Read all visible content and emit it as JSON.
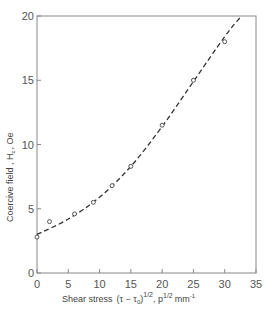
{
  "chart_data": {
    "type": "scatter",
    "title": "",
    "xlabel": "Shear stress (τ−τ₀)^1/2 , p^1/2 mm⁻¹",
    "ylabel": "Coercive field , Hc , Oe",
    "xlim": [
      0,
      35
    ],
    "ylim": [
      0,
      20
    ],
    "x_ticks": [
      0,
      5,
      10,
      15,
      20,
      25,
      30,
      35
    ],
    "y_ticks": [
      0,
      5,
      10,
      15,
      20
    ],
    "grid": false,
    "legend": null,
    "series": [
      {
        "name": "measured",
        "style": "open-circle",
        "x": [
          0,
          2,
          6,
          9,
          12,
          15,
          20,
          25,
          30
        ],
        "y": [
          2.8,
          4.0,
          4.6,
          5.5,
          6.8,
          8.3,
          11.5,
          15.0,
          18.0
        ]
      },
      {
        "name": "fit",
        "style": "dashed-line",
        "x": [
          0,
          5,
          10,
          15,
          20,
          25,
          30,
          32.5
        ],
        "y": [
          3.0,
          4.2,
          5.9,
          8.3,
          11.4,
          14.9,
          18.4,
          19.9
        ]
      }
    ]
  },
  "labels": {
    "x_axis": "Shear stress",
    "x_axis_formula": "(τ − τ",
    "x_axis_sub": "0",
    "x_axis_exp": "1/2",
    "x_axis_units_pre": ", p",
    "x_axis_units_exp": "1/2",
    "x_axis_units_post": "mm",
    "x_axis_units_exp2": "-1",
    "y_axis": "Coercive  field , H",
    "y_axis_sub": "c",
    "y_axis_units": ", Oe"
  },
  "ticks": {
    "x": [
      "0",
      "5",
      "10",
      "15",
      "20",
      "25",
      "30",
      "35"
    ],
    "y": [
      "0",
      "5",
      "10",
      "15",
      "20"
    ]
  }
}
